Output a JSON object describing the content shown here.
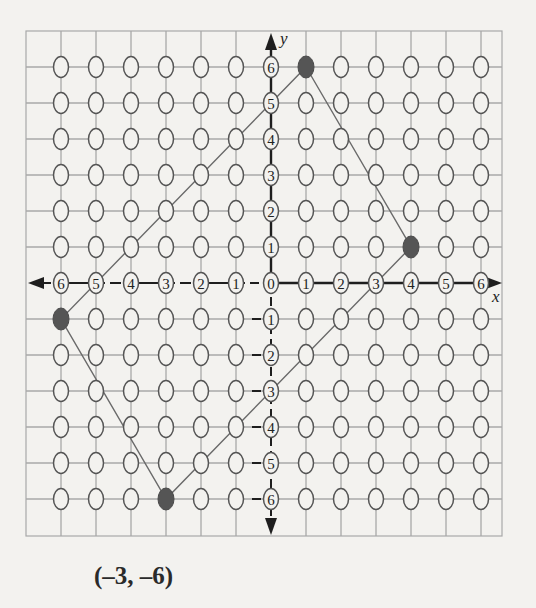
{
  "figure": {
    "caption": "(–3, –6)",
    "x_axis_label": "x",
    "y_axis_label": "y",
    "x_ticks": [
      -6,
      -5,
      -4,
      -3,
      -2,
      -1,
      0,
      1,
      2,
      3,
      4,
      5,
      6
    ],
    "y_ticks": [
      -6,
      -5,
      -4,
      -3,
      -2,
      -1,
      0,
      1,
      2,
      3,
      4,
      5,
      6
    ],
    "colors": {
      "background": "#f3f2ef",
      "grid": "#a8a8a8",
      "axis": "#1e1e1e",
      "circle_stroke": "#555555",
      "filled_point": "#555555",
      "polygon": "#6a6a6a"
    }
  },
  "chart_data": {
    "type": "scatter",
    "title": "",
    "xlabel": "x",
    "ylabel": "y",
    "xlim": [
      -6,
      6
    ],
    "ylim": [
      -6,
      6
    ],
    "grid": true,
    "grid_style": "lattice of open circles at every integer point",
    "series": [
      {
        "name": "plotted vertices (filled)",
        "points": [
          [
            1,
            6
          ],
          [
            4,
            1
          ],
          [
            -3,
            -6
          ],
          [
            -6,
            -1
          ]
        ]
      }
    ],
    "polygon": {
      "vertices_in_order": [
        [
          1,
          6
        ],
        [
          4,
          1
        ],
        [
          -3,
          -6
        ],
        [
          -6,
          -1
        ]
      ],
      "closed": true
    },
    "annotations": [
      "(–3, –6)"
    ]
  }
}
